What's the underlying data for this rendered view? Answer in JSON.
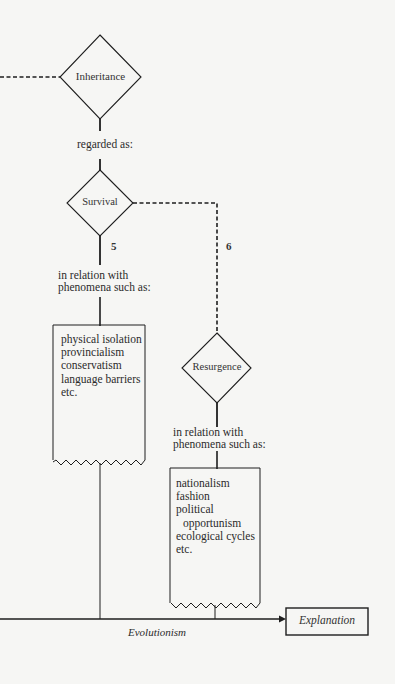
{
  "nodes": {
    "inheritance": {
      "label": "Inheritance"
    },
    "survival": {
      "label": "Survival"
    },
    "resurgence": {
      "label": "Resurgence"
    },
    "explanation": {
      "label": "Explanation"
    }
  },
  "connectors": {
    "regarded_as": "regarded as:",
    "branch_5": "5",
    "branch_6": "6",
    "relation_survival": [
      "in relation with",
      "phenomena such as:"
    ],
    "relation_resurgence": [
      "in relation with",
      "phenomena such as:"
    ],
    "axis_label": "Evolutionism"
  },
  "lists": {
    "survival_phenomena": [
      "physical isolation",
      "provincialism",
      "conservatism",
      "language barriers",
      "etc."
    ],
    "resurgence_phenomena": [
      "nationalism",
      "fashion",
      "political",
      "opportunism",
      "ecological cycles",
      "etc."
    ]
  },
  "colors": {
    "line": "#1e1e1e",
    "background": "#f6f6f4"
  }
}
